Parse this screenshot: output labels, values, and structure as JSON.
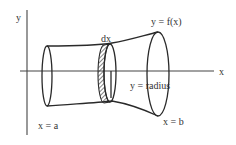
{
  "diagram": {
    "axes": {
      "x_label": "x",
      "y_label": "y"
    },
    "labels": {
      "dx": "dx",
      "curve": "y = f(x)",
      "radius": "y = radius",
      "left_bound": "x = a",
      "right_bound": "x = b"
    },
    "colors": {
      "stroke": "#2a2a2a",
      "axis": "#444444",
      "text": "#333333",
      "background": "#ffffff"
    }
  }
}
